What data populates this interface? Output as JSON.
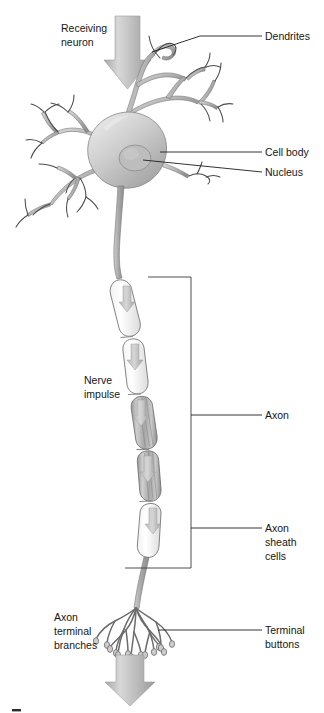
{
  "figure": {
    "background_color": "#ffffff",
    "line_color": "#1d1d1d",
    "cell_fill_color": "#c9c9c9",
    "myelin_fill_color": "#fbfbfb",
    "arrow_color": "#b4b4b4"
  },
  "labels": {
    "receiving_neuron": {
      "line1": "Receiving",
      "line2": "neuron"
    },
    "dendrites": "Dendrites",
    "cell_body": "Cell body",
    "nucleus": "Nucleus",
    "nerve_impulse": {
      "line1": "Nerve",
      "line2": "impulse"
    },
    "axon": "Axon",
    "axon_sheath_cells": {
      "line1": "Axon",
      "line2": "sheath",
      "line3": "cells"
    },
    "axon_terminal_branches": {
      "line1": "Axon",
      "line2": "terminal",
      "line3": "branches"
    },
    "terminal_buttons": {
      "line1": "Terminal",
      "line2": "buttons"
    }
  },
  "parts": [
    {
      "name": "dendrites",
      "description": "Branching receiving fibers at top of neuron"
    },
    {
      "name": "cell-body",
      "description": "Soma, the rounded central body"
    },
    {
      "name": "nucleus",
      "description": "Oval organelle inside the cell body"
    },
    {
      "name": "axon",
      "description": "Long fiber conducting the nerve impulse"
    },
    {
      "name": "axon-sheath-cells",
      "description": "Myelin segments wrapping the axon"
    },
    {
      "name": "axon-terminal-branches",
      "description": "Fanned branches at the axon end"
    },
    {
      "name": "terminal-buttons",
      "description": "Synaptic knobs at branch tips"
    }
  ],
  "impulse_arrows": {
    "count": 5,
    "direction": "downward",
    "meaning": "Direction of nerve impulse travel along the axon"
  }
}
